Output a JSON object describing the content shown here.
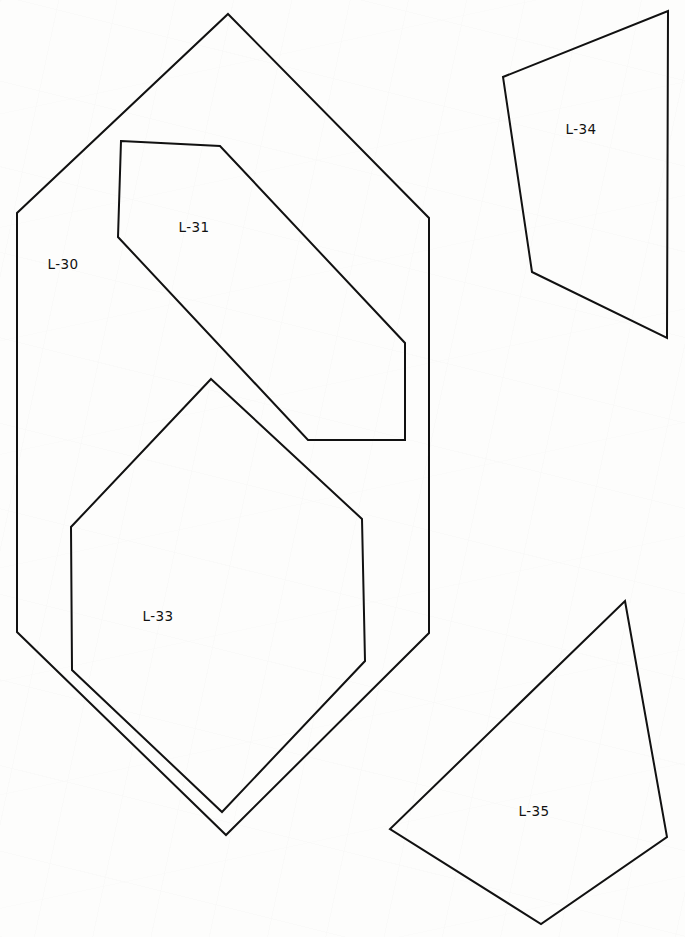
{
  "drawing": {
    "width": 685,
    "height": 937,
    "background_color": "#fdfdfc",
    "stroke_color": "#111111",
    "stroke_width": 2,
    "label_color": "#111111",
    "label_font_size": 13.5,
    "parcels": [
      {
        "id": "L-30",
        "label": "L-30",
        "label_x": 63,
        "label_y": 265,
        "vertex_count": 6,
        "points": "228,14 429,218 429,633 226,835 17,632 17,213",
        "vertices": [
          [
            228,
            14
          ],
          [
            429,
            218
          ],
          [
            429,
            633
          ],
          [
            226,
            835
          ],
          [
            17,
            632
          ],
          [
            17,
            213
          ]
        ]
      },
      {
        "id": "L-31",
        "label": "L-31",
        "label_x": 194,
        "label_y": 228,
        "vertex_count": 6,
        "points": "121,141 220,146 405,343 405,440 308,440 118,237",
        "vertices": [
          [
            121,
            141
          ],
          [
            220,
            146
          ],
          [
            405,
            343
          ],
          [
            405,
            440
          ],
          [
            308,
            440
          ],
          [
            118,
            237
          ]
        ]
      },
      {
        "id": "L-33",
        "label": "L-33",
        "label_x": 158,
        "label_y": 617,
        "vertex_count": 6,
        "points": "211,379 362,519 365,661 222,812 72,670 71,527",
        "vertices": [
          [
            211,
            379
          ],
          [
            362,
            519
          ],
          [
            365,
            661
          ],
          [
            222,
            812
          ],
          [
            72,
            670
          ],
          [
            71,
            527
          ]
        ]
      },
      {
        "id": "L-34",
        "label": "L-34",
        "label_x": 581,
        "label_y": 130,
        "vertex_count": 4,
        "points": "668,11 667,338 532,272 503,77",
        "vertices": [
          [
            668,
            11
          ],
          [
            667,
            338
          ],
          [
            532,
            272
          ],
          [
            503,
            77
          ]
        ]
      },
      {
        "id": "L-35",
        "label": "L-35",
        "label_x": 534,
        "label_y": 812,
        "vertex_count": 4,
        "points": "625,601 667,837 541,924 390,829",
        "vertices": [
          [
            625,
            601
          ],
          [
            667,
            837
          ],
          [
            541,
            924
          ],
          [
            390,
            829
          ]
        ]
      }
    ]
  }
}
